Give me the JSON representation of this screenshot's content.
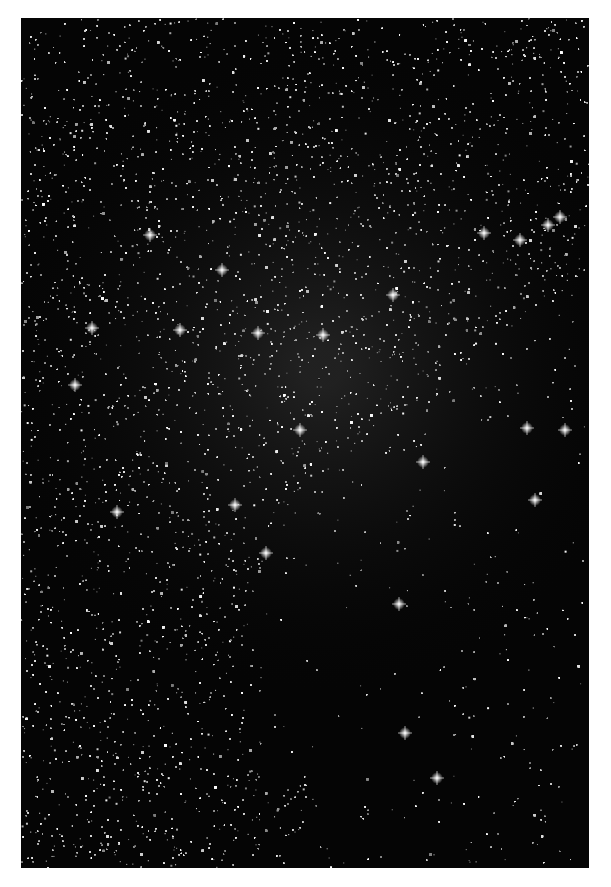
{
  "image": {
    "subject": "star field with nebula (grayscale astrophotography)",
    "frame": {
      "left": 21,
      "top": 18,
      "width": 568,
      "height": 850
    },
    "background_color": "#ffffff",
    "sky_color": "#050505",
    "bright_stars": [
      [
        150,
        235
      ],
      [
        92,
        328
      ],
      [
        258,
        333
      ],
      [
        222,
        270
      ],
      [
        393,
        295
      ],
      [
        323,
        335
      ],
      [
        300,
        430
      ],
      [
        423,
        462
      ],
      [
        565,
        430
      ],
      [
        527,
        428
      ],
      [
        560,
        217
      ],
      [
        520,
        240
      ],
      [
        548,
        225
      ],
      [
        117,
        512
      ],
      [
        266,
        553
      ],
      [
        399,
        604
      ],
      [
        437,
        778
      ],
      [
        405,
        733
      ],
      [
        484,
        233
      ],
      [
        75,
        385
      ],
      [
        180,
        330
      ],
      [
        235,
        505
      ],
      [
        535,
        500
      ]
    ],
    "dense_region_polygon": [
      [
        0,
        0
      ],
      [
        568,
        0
      ],
      [
        568,
        250
      ],
      [
        500,
        300
      ],
      [
        440,
        360
      ],
      [
        360,
        420
      ],
      [
        300,
        480
      ],
      [
        250,
        520
      ],
      [
        230,
        600
      ],
      [
        260,
        700
      ],
      [
        300,
        800
      ],
      [
        250,
        850
      ],
      [
        0,
        850
      ]
    ],
    "dark_nebula_patches": [
      [
        340,
        0,
        60,
        30
      ],
      [
        240,
        560,
        180,
        200
      ],
      [
        440,
        420,
        130,
        120
      ]
    ]
  }
}
